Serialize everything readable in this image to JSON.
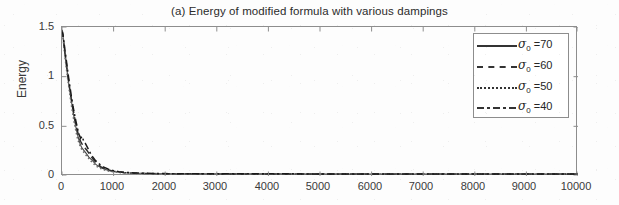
{
  "chart_data": {
    "type": "line",
    "title": "(a) Energy of modified formula with various dampings",
    "xlabel": "",
    "ylabel": "Energy",
    "xlim": [
      0,
      10000
    ],
    "ylim": [
      0,
      1.5
    ],
    "xticks": [
      0,
      1000,
      2000,
      3000,
      4000,
      5000,
      6000,
      7000,
      8000,
      9000,
      10000
    ],
    "xticklabels": [
      "0",
      "1000",
      "2000",
      "3000",
      "4000",
      "5000",
      "6000",
      "7000",
      "8000",
      "9000",
      "10000"
    ],
    "yticks": [
      0,
      0.5,
      1,
      1.5
    ],
    "yticklabels": [
      "0",
      "0.5",
      "1",
      "1.5"
    ],
    "grid": false,
    "legend_position": "upper right",
    "series": [
      {
        "name": "sigma_0 = 70",
        "label": "σ₀ =70",
        "linestyle": "solid",
        "color": "#4a4a4a",
        "x": [
          0,
          20,
          40,
          60,
          80,
          100,
          120,
          150,
          180,
          210,
          240,
          270,
          300,
          330,
          360,
          390,
          420,
          450,
          480,
          520,
          560,
          600,
          650,
          700,
          750,
          800,
          900,
          1000,
          1100,
          1200,
          1400,
          1600,
          2000,
          3000,
          4000,
          5000,
          6000,
          7000,
          8000,
          9000,
          10000
        ],
        "y": [
          1.47,
          1.4,
          1.3,
          1.21,
          1.13,
          1.05,
          0.97,
          0.86,
          0.76,
          0.66,
          0.57,
          0.49,
          0.42,
          0.36,
          0.31,
          0.28,
          0.26,
          0.24,
          0.22,
          0.19,
          0.17,
          0.15,
          0.12,
          0.1,
          0.085,
          0.072,
          0.055,
          0.045,
          0.038,
          0.033,
          0.028,
          0.025,
          0.023,
          0.021,
          0.021,
          0.02,
          0.02,
          0.02,
          0.02,
          0.02,
          0.02
        ]
      },
      {
        "name": "sigma_0 = 60",
        "label": "σ₀ =60",
        "linestyle": "dashed",
        "color": "#2e2e2e",
        "x": [
          0,
          20,
          40,
          60,
          80,
          100,
          120,
          150,
          180,
          210,
          240,
          270,
          300,
          330,
          360,
          390,
          420,
          450,
          480,
          520,
          560,
          600,
          650,
          700,
          750,
          800,
          900,
          1000,
          1100,
          1200,
          1400,
          1600,
          2000,
          3000,
          4000,
          5000,
          6000,
          7000,
          8000,
          9000,
          10000
        ],
        "y": [
          1.47,
          1.41,
          1.32,
          1.23,
          1.15,
          1.07,
          0.99,
          0.88,
          0.78,
          0.69,
          0.6,
          0.52,
          0.45,
          0.39,
          0.35,
          0.32,
          0.3,
          0.28,
          0.26,
          0.23,
          0.2,
          0.17,
          0.14,
          0.115,
          0.095,
          0.08,
          0.06,
          0.048,
          0.04,
          0.034,
          0.029,
          0.026,
          0.023,
          0.021,
          0.021,
          0.021,
          0.02,
          0.02,
          0.02,
          0.02,
          0.02
        ]
      },
      {
        "name": "sigma_0 = 50",
        "label": "σ₀ =50",
        "linestyle": "dotted",
        "color": "#6b6b6b",
        "x": [
          0,
          20,
          40,
          60,
          80,
          100,
          120,
          150,
          180,
          210,
          240,
          270,
          300,
          330,
          360,
          390,
          420,
          450,
          480,
          520,
          560,
          600,
          650,
          700,
          750,
          800,
          900,
          1000,
          1100,
          1200,
          1400,
          1600,
          2000,
          3000,
          4000,
          5000,
          6000,
          7000,
          8000,
          9000,
          10000
        ],
        "y": [
          1.47,
          1.39,
          1.29,
          1.19,
          1.1,
          1.02,
          0.94,
          0.83,
          0.72,
          0.62,
          0.53,
          0.45,
          0.38,
          0.33,
          0.29,
          0.26,
          0.24,
          0.22,
          0.2,
          0.175,
          0.15,
          0.13,
          0.105,
          0.088,
          0.075,
          0.064,
          0.05,
          0.042,
          0.036,
          0.031,
          0.027,
          0.024,
          0.022,
          0.021,
          0.02,
          0.02,
          0.02,
          0.02,
          0.02,
          0.02,
          0.02
        ]
      },
      {
        "name": "sigma_0 = 40",
        "label": "σ₀ =40",
        "linestyle": "dashdot",
        "color": "#1a1a1a",
        "x": [
          0,
          20,
          40,
          60,
          80,
          100,
          120,
          150,
          180,
          210,
          240,
          270,
          300,
          330,
          360,
          390,
          420,
          450,
          480,
          520,
          560,
          600,
          650,
          700,
          750,
          800,
          900,
          1000,
          1100,
          1200,
          1400,
          1600,
          2000,
          3000,
          4000,
          5000,
          6000,
          7000,
          8000,
          9000,
          10000
        ],
        "y": [
          1.47,
          1.42,
          1.34,
          1.26,
          1.18,
          1.1,
          1.02,
          0.91,
          0.81,
          0.71,
          0.63,
          0.55,
          0.48,
          0.42,
          0.38,
          0.4,
          0.35,
          0.33,
          0.3,
          0.26,
          0.22,
          0.19,
          0.155,
          0.13,
          0.11,
          0.092,
          0.068,
          0.054,
          0.044,
          0.037,
          0.031,
          0.027,
          0.024,
          0.022,
          0.022,
          0.021,
          0.021,
          0.021,
          0.02,
          0.02,
          0.02
        ]
      }
    ]
  },
  "legend": {
    "entries": [
      {
        "label": "σ₀ =70",
        "sigma": "σ",
        "sub": "0",
        "value": "=70",
        "style": "solid"
      },
      {
        "label": "σ₀ =60",
        "sigma": "σ",
        "sub": "0",
        "value": "=60",
        "style": "dashed"
      },
      {
        "label": "σ₀ =50",
        "sigma": "σ",
        "sub": "0",
        "value": "=50",
        "style": "dotted"
      },
      {
        "label": "σ₀ =40",
        "sigma": "σ",
        "sub": "0",
        "value": "=40",
        "style": "dashdot"
      }
    ]
  },
  "axes": {
    "ylabel": "Energy",
    "ytick_0": "0",
    "ytick_1": "0.5",
    "ytick_2": "1",
    "ytick_3": "1.5",
    "xtick_0": "0",
    "xtick_1": "1000",
    "xtick_2": "2000",
    "xtick_3": "3000",
    "xtick_4": "4000",
    "xtick_5": "5000",
    "xtick_6": "6000",
    "xtick_7": "7000",
    "xtick_8": "8000",
    "xtick_9": "9000",
    "xtick_10": "10000"
  },
  "colors": {
    "axis": "#8d8d8d",
    "text": "#3a3a3a",
    "curve_dark": "#1a1a1a",
    "curve_mid": "#4a4a4a",
    "curve_light": "#6b6b6b",
    "background": "#fdfdfd"
  }
}
